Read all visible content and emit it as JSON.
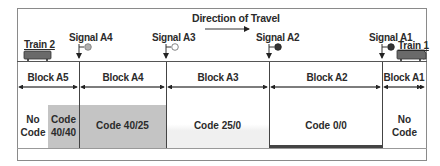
{
  "diagram": {
    "direction_label": "Direction of Travel",
    "trains": [
      {
        "label": "Train 2",
        "position": "Block A5"
      },
      {
        "label": "Train 1",
        "position": "Block A1"
      }
    ],
    "signals": [
      {
        "label": "Signal A4",
        "aspect": "gray"
      },
      {
        "label": "Signal A3",
        "aspect": "white"
      },
      {
        "label": "Signal A2",
        "aspect": "dark"
      },
      {
        "label": "Signal A1",
        "aspect": "dark"
      }
    ],
    "blocks": [
      {
        "label": "Block A5"
      },
      {
        "label": "Block A4"
      },
      {
        "label": "Block A3"
      },
      {
        "label": "Block A2"
      },
      {
        "label": "Block A1"
      }
    ],
    "codes": [
      {
        "line1": "No",
        "line2": "Code"
      },
      {
        "line1": "Code",
        "line2": "40/40"
      },
      {
        "label": "Code 40/25"
      },
      {
        "label": "Code 25/0"
      },
      {
        "label": "Code 0/0"
      },
      {
        "line1": "No",
        "line2": "Code"
      }
    ],
    "colors": {
      "shade_gray": "#c4c4c4",
      "shade_light": "#f2f2f2",
      "dark_bar": "#444444",
      "signal_gray": "#b0b0b0",
      "signal_dark": "#333333",
      "train_fill": "#6a6a6a"
    }
  }
}
